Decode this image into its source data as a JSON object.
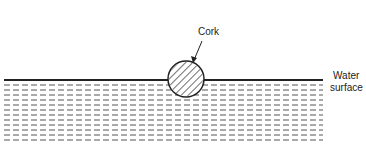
{
  "diagram": {
    "labels": {
      "cork": "Cork",
      "water_line1": "Water",
      "water_line2": "surface"
    },
    "colors": {
      "ink": "#222222",
      "background": "#ffffff"
    },
    "shapes": {
      "cork": {
        "shape": "circle",
        "fill": "diagonal-hatch",
        "cx": 186,
        "cy": 79,
        "r": 18
      },
      "water_surface": {
        "y": 80,
        "x_start": 0,
        "x_end": 323
      },
      "water_dash_rows": 13
    }
  }
}
